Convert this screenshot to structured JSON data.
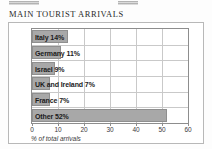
{
  "document": {
    "title": "MAIN TOURIST ARRIVALS",
    "top_fragments": [
      "clipped-toolbar-fragment-left",
      "clipped-toolbar-fragment-right"
    ]
  },
  "colors": {
    "bar_fill": "#a8a8a8",
    "bar_border": "#8f8f8f",
    "grid": "#c9c9c9",
    "axis": "#8d8d8d",
    "frame": "#b8b8b8",
    "text": "#1b1b1b",
    "page_background": "#fdfdfd"
  },
  "chart_data": {
    "type": "bar",
    "orientation": "horizontal",
    "title": "MAIN TOURIST ARRIVALS",
    "xlabel": "% of total arrivals",
    "ylabel": "",
    "categories": [
      "Italy",
      "Germany",
      "Israel",
      "UK and Ireland",
      "France",
      "Other"
    ],
    "values": [
      14,
      11,
      9,
      7,
      7,
      52
    ],
    "data_labels": [
      "Italy 14%",
      "Germany 11%",
      "Israel 9%",
      "UK and Ireland 7%",
      "France 7%",
      "Other 52%"
    ],
    "xlim": [
      0,
      60
    ],
    "xticks": [
      0,
      10,
      20,
      30,
      40,
      50,
      60
    ],
    "xtick_labels": [
      "0",
      "10",
      "20",
      "30",
      "40",
      "50",
      "60"
    ],
    "grid": true,
    "grid_axis": "both",
    "legend": false,
    "units": "percent"
  }
}
